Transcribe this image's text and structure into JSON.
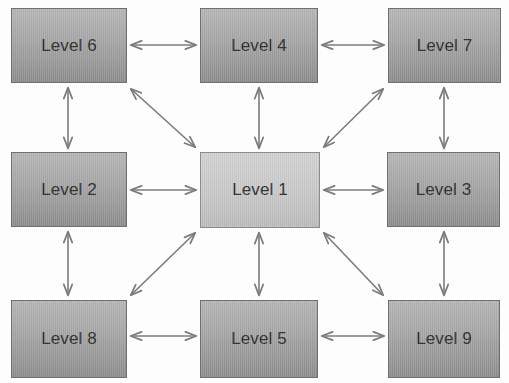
{
  "diagram": {
    "background_color": "#fdfdfd",
    "node_fill_top": "#b6b6b6",
    "node_fill_bottom": "#8e8e8e",
    "center_node_fill_top": "#d2d2d2",
    "center_node_fill_bottom": "#bdbdbd",
    "node_border_color": "#6f6f6f",
    "node_text_color": "#2b2b2b",
    "arrow_color": "#7b7b7b",
    "arrow_style": "double-headed",
    "nodes": [
      {
        "id": "level6",
        "label": "Level 6",
        "x": 11,
        "y": 8,
        "w": 116,
        "h": 75,
        "emphasis": "normal"
      },
      {
        "id": "level4",
        "label": "Level 4",
        "x": 200,
        "y": 8,
        "w": 118,
        "h": 75,
        "emphasis": "normal"
      },
      {
        "id": "level7",
        "label": "Level 7",
        "x": 388,
        "y": 8,
        "w": 113,
        "h": 75,
        "emphasis": "normal"
      },
      {
        "id": "level2",
        "label": "Level 2",
        "x": 11,
        "y": 152,
        "w": 116,
        "h": 75,
        "emphasis": "normal"
      },
      {
        "id": "level1",
        "label": "Level 1",
        "x": 200,
        "y": 152,
        "w": 120,
        "h": 76,
        "emphasis": "center"
      },
      {
        "id": "level3",
        "label": "Level 3",
        "x": 387,
        "y": 152,
        "w": 113,
        "h": 75,
        "emphasis": "normal"
      },
      {
        "id": "level8",
        "label": "Level 8",
        "x": 11,
        "y": 300,
        "w": 116,
        "h": 78,
        "emphasis": "normal"
      },
      {
        "id": "level5",
        "label": "Level 5",
        "x": 200,
        "y": 300,
        "w": 118,
        "h": 78,
        "emphasis": "normal"
      },
      {
        "id": "level9",
        "label": "Level 9",
        "x": 388,
        "y": 300,
        "w": 112,
        "h": 78,
        "emphasis": "normal"
      }
    ],
    "connections": [
      {
        "id": "level6-level4",
        "from": "level6",
        "to": "level4",
        "orientation": "horizontal",
        "x1": 131,
        "y1": 45,
        "x2": 196,
        "y2": 45
      },
      {
        "id": "level4-level7",
        "from": "level4",
        "to": "level7",
        "orientation": "horizontal",
        "x1": 322,
        "y1": 45,
        "x2": 384,
        "y2": 45
      },
      {
        "id": "level2-level1",
        "from": "level2",
        "to": "level1",
        "orientation": "horizontal",
        "x1": 131,
        "y1": 190,
        "x2": 196,
        "y2": 190
      },
      {
        "id": "level1-level3",
        "from": "level1",
        "to": "level3",
        "orientation": "horizontal",
        "x1": 324,
        "y1": 190,
        "x2": 383,
        "y2": 190
      },
      {
        "id": "level8-level5",
        "from": "level8",
        "to": "level5",
        "orientation": "horizontal",
        "x1": 131,
        "y1": 336,
        "x2": 196,
        "y2": 336
      },
      {
        "id": "level5-level9",
        "from": "level5",
        "to": "level9",
        "orientation": "horizontal",
        "x1": 322,
        "y1": 336,
        "x2": 384,
        "y2": 336
      },
      {
        "id": "level6-level2",
        "from": "level6",
        "to": "level2",
        "orientation": "vertical",
        "x1": 68,
        "y1": 88,
        "x2": 68,
        "y2": 148
      },
      {
        "id": "level2-level8",
        "from": "level2",
        "to": "level8",
        "orientation": "vertical",
        "x1": 68,
        "y1": 232,
        "x2": 68,
        "y2": 295
      },
      {
        "id": "level7-level3",
        "from": "level7",
        "to": "level3",
        "orientation": "vertical",
        "x1": 444,
        "y1": 88,
        "x2": 444,
        "y2": 148
      },
      {
        "id": "level3-level9",
        "from": "level3",
        "to": "level9",
        "orientation": "vertical",
        "x1": 444,
        "y1": 232,
        "x2": 444,
        "y2": 295
      },
      {
        "id": "level4-level1",
        "from": "level4",
        "to": "level1",
        "orientation": "vertical",
        "x1": 259,
        "y1": 88,
        "x2": 259,
        "y2": 148
      },
      {
        "id": "level1-level5",
        "from": "level1",
        "to": "level5",
        "orientation": "vertical",
        "x1": 259,
        "y1": 233,
        "x2": 259,
        "y2": 295
      },
      {
        "id": "level6-level1",
        "from": "level6",
        "to": "level1",
        "orientation": "diagonal",
        "x1": 131,
        "y1": 89,
        "x2": 195,
        "y2": 147
      },
      {
        "id": "level7-level1",
        "from": "level7",
        "to": "level1",
        "orientation": "diagonal",
        "x1": 383,
        "y1": 89,
        "x2": 324,
        "y2": 147
      },
      {
        "id": "level8-level1",
        "from": "level8",
        "to": "level1",
        "orientation": "diagonal",
        "x1": 131,
        "y1": 295,
        "x2": 195,
        "y2": 233
      },
      {
        "id": "level9-level1",
        "from": "level9",
        "to": "level1",
        "orientation": "diagonal",
        "x1": 383,
        "y1": 295,
        "x2": 324,
        "y2": 233
      }
    ]
  }
}
